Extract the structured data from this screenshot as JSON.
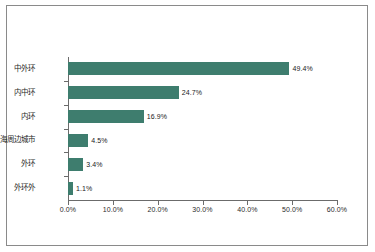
{
  "chart_data": {
    "type": "bar",
    "orientation": "horizontal",
    "title": "",
    "subtitle": "",
    "xlabel": "",
    "ylabel": "",
    "xlim": [
      0,
      60
    ],
    "grid": false,
    "legend": null,
    "series_color": "#3e7d6e",
    "categories": [
      "中外环",
      "内中环",
      "内环",
      "上海周边城市",
      "外环",
      "外环外"
    ],
    "values": [
      49.4,
      24.7,
      16.9,
      4.5,
      3.4,
      1.1
    ],
    "value_labels": [
      "49.4%",
      "24.7%",
      "16.9%",
      "4.5%",
      "3.4%",
      "1.1%"
    ],
    "xticks": [
      0,
      10,
      20,
      30,
      40,
      50,
      60
    ],
    "xtick_labels": [
      "0.0%",
      "10.0%",
      "20.0%",
      "30.0%",
      "40.0%",
      "50.0%",
      "60.0%"
    ]
  },
  "figure": {
    "background_color": "#ffffff",
    "frame_color": "#8a8a8a",
    "axis_color": "#6b6b6b"
  }
}
